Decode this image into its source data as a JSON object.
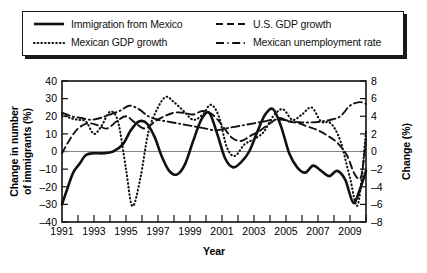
{
  "legend": {
    "entries": [
      {
        "label": "Immigration from Mexico",
        "style": "solid"
      },
      {
        "label": "U.S. GDP growth",
        "style": "dashed"
      },
      {
        "label": "Mexican GDP growth",
        "style": "dotted"
      },
      {
        "label": "Mexican unemployment rate",
        "style": "dash-dot"
      }
    ]
  },
  "chart_data": {
    "type": "line",
    "title": "",
    "xlabel": "Year",
    "ylabel": "Change in number of immigrants (%)",
    "y2label": "Change (%)",
    "xlim": [
      1991,
      2010
    ],
    "ylim": [
      -40,
      40
    ],
    "y2lim": [
      -8,
      8
    ],
    "grid": false,
    "legend_position": "top",
    "xticks": [
      1991,
      1992,
      1993,
      1994,
      1995,
      1996,
      1997,
      1998,
      1999,
      2000,
      2001,
      2002,
      2003,
      2004,
      2005,
      2006,
      2007,
      2008,
      2009,
      2010
    ],
    "xticklabels": [
      "1991",
      "",
      "1993",
      "",
      "1995",
      "",
      "1997",
      "",
      "1999",
      "",
      "2001",
      "",
      "2003",
      "",
      "2005",
      "",
      "2007",
      "",
      "2009",
      ""
    ],
    "yticks": [
      -40,
      -30,
      -20,
      -10,
      0,
      10,
      20,
      30,
      40
    ],
    "yticklabels": [
      "–40",
      "–30",
      "–20",
      "–10",
      "0",
      "10",
      "20",
      "30",
      "40"
    ],
    "y2ticks": [
      -8,
      -6,
      -4,
      -2,
      0,
      2,
      4,
      6,
      8
    ],
    "y2ticklabels": [
      "–8",
      "–6",
      "–4",
      "–2",
      "0",
      "2",
      "4",
      "6",
      "8"
    ],
    "series": [
      {
        "name": "Immigration from Mexico",
        "axis": "left",
        "style": "solid",
        "x": [
          1991,
          1991.3,
          1991.7,
          1992.1,
          1992.5,
          1993.0,
          1993.6,
          1994.2,
          1994.8,
          1995.3,
          1995.8,
          1996.3,
          1996.8,
          1997.2,
          1997.7,
          1998.2,
          1998.7,
          1999.2,
          1999.7,
          2000.2,
          2000.7,
          2001.2,
          2001.7,
          2002.2,
          2002.7,
          2003.2,
          2003.7,
          2004.2,
          2004.7,
          2005.2,
          2005.7,
          2006.2,
          2006.7,
          2007.2,
          2007.7,
          2008.2,
          2008.7,
          2009.2,
          2009.6,
          2010.0
        ],
        "values": [
          -30,
          -22,
          -12,
          -7,
          -2,
          -1,
          -1,
          0,
          4,
          12,
          17,
          16,
          8,
          -2,
          -11,
          -13,
          -7,
          6,
          18,
          22,
          10,
          -4,
          -9,
          -6,
          0,
          11,
          21,
          24,
          14,
          -1,
          -9,
          -12,
          -8,
          -11,
          -14,
          -11,
          -16,
          -29,
          -22,
          -11
        ]
      },
      {
        "name": "Mexican GDP growth",
        "axis": "right",
        "style": "dotted",
        "x": [
          1991,
          1991.5,
          1992.0,
          1992.5,
          1993.0,
          1993.5,
          1994.0,
          1994.5,
          1995.0,
          1995.4,
          1995.9,
          1996.4,
          1997.0,
          1997.5,
          1998.0,
          1998.6,
          1999.2,
          1999.8,
          2000.3,
          2000.8,
          2001.3,
          2001.8,
          2002.4,
          2003.0,
          2003.6,
          2004.2,
          2004.8,
          2005.4,
          2006.0,
          2006.6,
          2007.2,
          2007.8,
          2008.4,
          2009.0,
          2009.5,
          2010.0
        ],
        "values": [
          4.2,
          3.8,
          3.6,
          3.4,
          2.0,
          3.0,
          4.5,
          3.4,
          -2.0,
          -6.2,
          -3.0,
          2.2,
          5.0,
          6.2,
          5.6,
          4.6,
          3.6,
          4.2,
          5.3,
          4.0,
          0.5,
          -0.5,
          0.8,
          1.4,
          2.2,
          4.0,
          4.8,
          3.6,
          4.2,
          5.0,
          3.4,
          3.2,
          1.2,
          -3.0,
          -6.0,
          2.2
        ]
      },
      {
        "name": "U.S. GDP growth",
        "axis": "right",
        "style": "dashed",
        "x": [
          1991,
          1991.5,
          1992.0,
          1992.6,
          1993.2,
          1993.8,
          1994.4,
          1995.0,
          1995.6,
          1996.2,
          1996.8,
          1997.4,
          1998.0,
          1998.6,
          1999.2,
          1999.8,
          2000.4,
          2001.0,
          2001.6,
          2002.2,
          2002.8,
          2003.4,
          2004.0,
          2004.6,
          2005.2,
          2005.8,
          2006.4,
          2007.0,
          2007.6,
          2008.2,
          2008.8,
          2009.3,
          2009.7,
          2010.0
        ],
        "values": [
          -0.2,
          1.4,
          2.6,
          3.2,
          3.0,
          2.6,
          3.4,
          4.0,
          3.2,
          2.6,
          3.4,
          4.0,
          4.4,
          4.4,
          4.2,
          4.6,
          4.2,
          3.0,
          1.6,
          1.2,
          1.8,
          2.4,
          3.2,
          3.8,
          3.4,
          3.2,
          2.8,
          2.4,
          1.8,
          1.0,
          -0.4,
          -2.6,
          -2.8,
          1.4
        ]
      },
      {
        "name": "Mexican unemployment rate",
        "axis": "right",
        "style": "dash-dot",
        "x": [
          1991,
          1991.6,
          1992.2,
          1992.8,
          1993.4,
          1994.0,
          1994.6,
          1995.2,
          1995.8,
          1996.4,
          1997.0,
          1997.6,
          1998.2,
          1998.8,
          1999.4,
          2000.0,
          2000.6,
          2001.2,
          2001.8,
          2002.4,
          2003.0,
          2003.6,
          2004.2,
          2004.8,
          2005.4,
          2006.0,
          2006.6,
          2007.2,
          2007.8,
          2008.4,
          2009.0,
          2009.6,
          2010.0
        ],
        "values": [
          4.4,
          4.0,
          3.8,
          3.6,
          3.8,
          4.2,
          4.6,
          5.2,
          4.8,
          4.0,
          3.6,
          3.4,
          3.2,
          3.0,
          2.8,
          2.6,
          2.4,
          2.6,
          2.8,
          3.0,
          3.2,
          3.4,
          3.6,
          3.6,
          3.4,
          3.3,
          3.3,
          3.4,
          3.6,
          4.0,
          5.2,
          5.6,
          5.4
        ]
      }
    ]
  }
}
